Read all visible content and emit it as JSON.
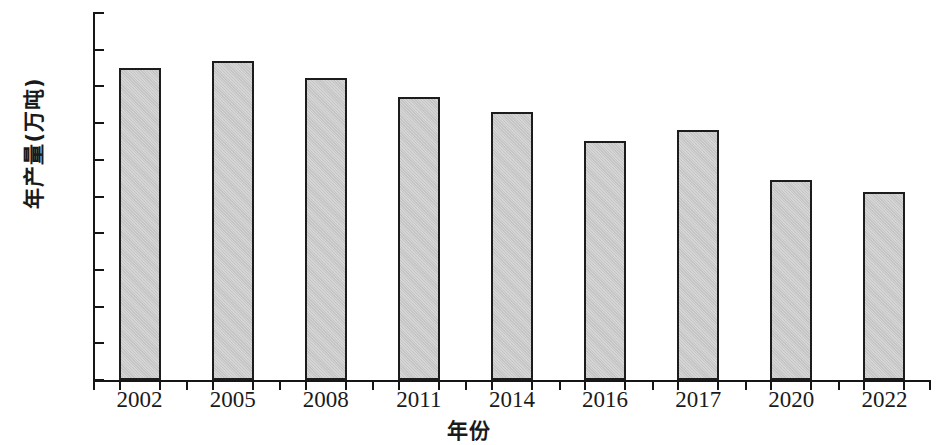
{
  "chart_data": {
    "type": "bar",
    "title": "",
    "xlabel": "年份",
    "ylabel": "年产量(万吨)",
    "categories": [
      "2002",
      "2005",
      "2008",
      "2011",
      "2014",
      "2016",
      "2017",
      "2020",
      "2022"
    ],
    "values": [
      425,
      435,
      411,
      385,
      365,
      326,
      341,
      272,
      256
    ],
    "ylim": [
      0,
      500
    ],
    "y_ticks": [
      0,
      50,
      100,
      150,
      200,
      250,
      300,
      350,
      400,
      450,
      500
    ],
    "y_tick_labels": [
      "0",
      "50",
      "100",
      "150",
      "200",
      "250",
      "300",
      "350",
      "400",
      "450",
      "500"
    ],
    "grid": false,
    "legend": "none",
    "series": [
      {
        "name": "年产量",
        "values": [
          425,
          435,
          411,
          385,
          365,
          326,
          341,
          272,
          256
        ]
      }
    ],
    "bar_fill_color": "#c9c9c9",
    "bar_edge_color": "#1c1c1c",
    "axis_color": "#161616",
    "background_color": "#ffffff"
  }
}
